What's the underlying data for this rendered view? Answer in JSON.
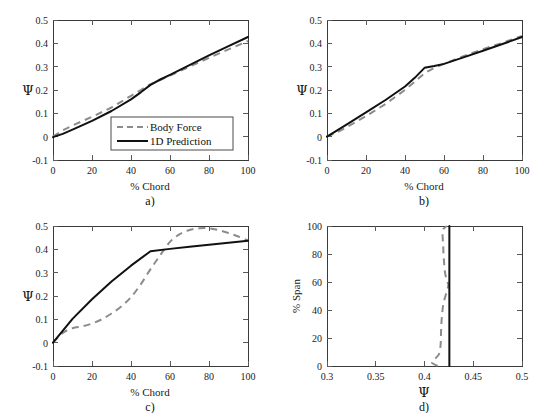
{
  "figure": {
    "background_color": "#ffffff",
    "series_colors": {
      "body_force": "#8c8c8c",
      "prediction": "#111111"
    }
  },
  "legend": {
    "entries": [
      {
        "label": "Body Force",
        "style": "dashed",
        "color": "#8c8c8c"
      },
      {
        "label": "1D Prediction",
        "style": "solid",
        "color": "#111111"
      }
    ],
    "shown_in_panel": "a"
  },
  "chart_data": [
    {
      "id": "a",
      "type": "line",
      "panel_label": "a)",
      "title": "",
      "xlabel": "% Chord",
      "ylabel": "Ψ",
      "xlim": [
        0,
        100
      ],
      "ylim": [
        -0.1,
        0.5
      ],
      "xticks": [
        "0",
        "20",
        "40",
        "60",
        "80",
        "100"
      ],
      "yticks": [
        "-0.1",
        "0",
        "0.1",
        "0.2",
        "0.3",
        "0.4",
        "0.5"
      ],
      "grid": false,
      "legend_position": "lower right",
      "series": [
        {
          "name": "Body Force",
          "style": "dashed",
          "x": [
            0,
            5,
            10,
            20,
            30,
            40,
            45,
            50,
            55,
            60,
            70,
            80,
            90,
            100
          ],
          "values": [
            0.0,
            0.027,
            0.048,
            0.085,
            0.125,
            0.175,
            0.2,
            0.225,
            0.243,
            0.262,
            0.3,
            0.338,
            0.374,
            0.41
          ]
        },
        {
          "name": "1D Prediction",
          "style": "solid",
          "x": [
            0,
            5,
            10,
            20,
            30,
            40,
            45,
            50,
            55,
            60,
            70,
            80,
            90,
            100
          ],
          "values": [
            -0.002,
            0.012,
            0.03,
            0.068,
            0.11,
            0.16,
            0.19,
            0.222,
            0.245,
            0.265,
            0.307,
            0.348,
            0.388,
            0.427
          ]
        }
      ]
    },
    {
      "id": "b",
      "type": "line",
      "panel_label": "b)",
      "title": "",
      "xlabel": "% Chord",
      "ylabel": "Ψ",
      "xlim": [
        0,
        100
      ],
      "ylim": [
        -0.1,
        0.5
      ],
      "xticks": [
        "0",
        "20",
        "40",
        "60",
        "80",
        "100"
      ],
      "yticks": [
        "-0.1",
        "0",
        "0.1",
        "0.2",
        "0.3",
        "0.4",
        "0.5"
      ],
      "grid": false,
      "legend_position": "none",
      "series": [
        {
          "name": "Body Force",
          "style": "dashed",
          "x": [
            0,
            5,
            10,
            20,
            30,
            40,
            45,
            50,
            55,
            60,
            70,
            80,
            90,
            100
          ],
          "values": [
            0.0,
            0.018,
            0.04,
            0.088,
            0.14,
            0.2,
            0.235,
            0.272,
            0.295,
            0.312,
            0.345,
            0.375,
            0.402,
            0.432
          ]
        },
        {
          "name": "1D Prediction",
          "style": "solid",
          "x": [
            0,
            5,
            10,
            20,
            30,
            40,
            45,
            50,
            55,
            60,
            70,
            80,
            90,
            100
          ],
          "values": [
            0.0,
            0.026,
            0.052,
            0.104,
            0.157,
            0.215,
            0.252,
            0.295,
            0.303,
            0.312,
            0.34,
            0.368,
            0.397,
            0.427
          ]
        }
      ]
    },
    {
      "id": "c",
      "type": "line",
      "panel_label": "c)",
      "title": "",
      "xlabel": "% Chord",
      "ylabel": "Ψ",
      "xlim": [
        0,
        100
      ],
      "ylim": [
        -0.1,
        0.5
      ],
      "xticks": [
        "0",
        "20",
        "40",
        "60",
        "80",
        "100"
      ],
      "yticks": [
        "-0.1",
        "0",
        "0.1",
        "0.2",
        "0.3",
        "0.4",
        "0.5"
      ],
      "grid": false,
      "legend_position": "none",
      "series": [
        {
          "name": "Body Force",
          "style": "dashed",
          "x": [
            0,
            5,
            10,
            15,
            20,
            25,
            30,
            35,
            40,
            45,
            50,
            55,
            60,
            65,
            70,
            75,
            80,
            85,
            90,
            95,
            100
          ],
          "values": [
            0.0,
            0.042,
            0.062,
            0.07,
            0.082,
            0.1,
            0.125,
            0.155,
            0.195,
            0.25,
            0.315,
            0.375,
            0.432,
            0.465,
            0.483,
            0.49,
            0.49,
            0.482,
            0.47,
            0.455,
            0.438
          ]
        },
        {
          "name": "1D Prediction",
          "style": "solid",
          "x": [
            0,
            10,
            20,
            30,
            40,
            50,
            60,
            70,
            80,
            90,
            100
          ],
          "values": [
            0.0,
            0.102,
            0.186,
            0.262,
            0.33,
            0.392,
            0.402,
            0.411,
            0.42,
            0.428,
            0.437
          ]
        }
      ]
    },
    {
      "id": "d",
      "type": "line",
      "panel_label": "d)",
      "title": "",
      "xlabel": "Ψ",
      "ylabel": "% Span",
      "xlim": [
        0.3,
        0.5
      ],
      "ylim": [
        0,
        100
      ],
      "xticks": [
        "0.3",
        "0.35",
        "0.4",
        "0.45",
        "0.5"
      ],
      "yticks": [
        "0",
        "20",
        "40",
        "60",
        "80",
        "100"
      ],
      "grid": false,
      "legend_position": "none",
      "orientation": "vertical",
      "series": [
        {
          "name": "Body Force",
          "style": "dashed",
          "y_span": [
            0,
            2,
            4,
            6,
            8,
            10,
            15,
            20,
            25,
            30,
            35,
            40,
            45,
            50,
            55,
            58,
            60,
            65,
            70,
            75,
            80,
            85,
            90,
            95,
            98,
            100
          ],
          "values": [
            0.4135,
            0.408,
            0.409,
            0.412,
            0.4145,
            0.4155,
            0.4165,
            0.4168,
            0.417,
            0.4173,
            0.4178,
            0.4185,
            0.4195,
            0.4215,
            0.4235,
            0.4245,
            0.4235,
            0.4215,
            0.4205,
            0.42,
            0.4195,
            0.4192,
            0.4188,
            0.4185,
            0.4195,
            0.423
          ]
        },
        {
          "name": "1D Prediction",
          "style": "solid",
          "y_span": [
            0,
            100
          ],
          "values": [
            0.4255,
            0.4255
          ]
        }
      ]
    }
  ]
}
